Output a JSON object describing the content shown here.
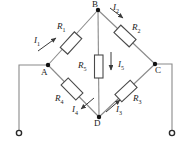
{
  "diagram": {
    "type": "circuit-schematic",
    "colors": {
      "wire": "#8a8a8a",
      "component_stroke": "#4a4a4a",
      "node": "#111111",
      "text": "#1a1a1a",
      "background": "#ffffff"
    },
    "nodes": [
      {
        "id": "A",
        "label": "A",
        "x": 48,
        "y": 65,
        "label_x": 42,
        "label_y": 68
      },
      {
        "id": "B",
        "label": "B",
        "x": 98,
        "y": 10,
        "label_x": 92,
        "label_y": 0
      },
      {
        "id": "C",
        "label": "C",
        "x": 155,
        "y": 64,
        "label_x": 154,
        "label_y": 66
      },
      {
        "id": "D",
        "label": "D",
        "x": 99,
        "y": 117,
        "label_x": 94,
        "label_y": 119
      }
    ],
    "terminals": [
      {
        "id": "left-terminal",
        "x": 9,
        "y": 133
      },
      {
        "id": "right-terminal",
        "x": 182,
        "y": 133
      }
    ],
    "resistors": [
      {
        "id": "R1",
        "label": "R",
        "sub": "1",
        "branch": "A-B",
        "label_x": 57,
        "label_y": 25
      },
      {
        "id": "R2",
        "label": "R",
        "sub": "2",
        "branch": "B-C",
        "label_x": 132,
        "label_y": 26
      },
      {
        "id": "R3",
        "label": "R",
        "sub": "3",
        "branch": "D-C",
        "label_x": 131,
        "label_y": 96
      },
      {
        "id": "R4",
        "label": "R",
        "sub": "4",
        "branch": "A-D",
        "label_x": 56,
        "label_y": 96
      },
      {
        "id": "R5",
        "label": "R",
        "sub": "5",
        "branch": "B-D",
        "label_x": 80,
        "label_y": 62
      }
    ],
    "currents": [
      {
        "id": "I1",
        "label": "I",
        "sub": "1",
        "branch": "A-B",
        "direction": "A to B",
        "label_x": 36,
        "label_y": 38
      },
      {
        "id": "I2",
        "label": "I",
        "sub": "2",
        "branch": "B-C",
        "direction": "B to C",
        "label_x": 113,
        "label_y": 6
      },
      {
        "id": "I3",
        "label": "I",
        "sub": "3",
        "branch": "D-C",
        "direction": "D to C",
        "label_x": 113,
        "label_y": 108
      },
      {
        "id": "I4",
        "label": "I",
        "sub": "4",
        "branch": "A-D",
        "direction": "A to D",
        "label_x": 74,
        "label_y": 108
      },
      {
        "id": "I5",
        "label": "I",
        "sub": "5",
        "branch": "B-D",
        "direction": "B to D",
        "label_x": 119,
        "label_y": 62
      }
    ]
  }
}
